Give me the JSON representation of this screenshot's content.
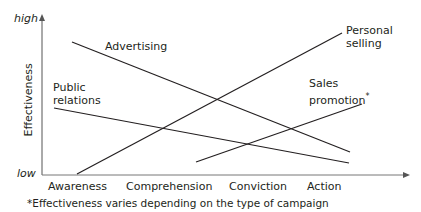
{
  "diagram": {
    "y_axis": {
      "label": "Effectiveness",
      "high": "high",
      "low": "low"
    },
    "x_axis": {
      "categories": [
        "Awareness",
        "Comprehension",
        "Conviction",
        "Action"
      ]
    },
    "series": [
      {
        "name": "Advertising",
        "label": "Advertising",
        "trend": "decreasing"
      },
      {
        "name": "Public relations",
        "label_line1": "Public",
        "label_line2": "relations",
        "trend": "decreasing"
      },
      {
        "name": "Personal selling",
        "label_line1": "Personal",
        "label_line2": "selling",
        "trend": "increasing"
      },
      {
        "name": "Sales promotion",
        "label_line1": "Sales",
        "label_line2": "promotion",
        "marker": "*",
        "trend": "increasing"
      }
    ],
    "footnote": "*Effectiveness varies depending on the type of campaign",
    "line_color": "#231f20",
    "axis_color": "#7f7f7f"
  }
}
